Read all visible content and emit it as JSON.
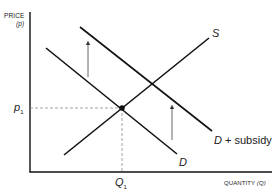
{
  "diagram": {
    "y_axis": {
      "title": "PRICE",
      "symbol": "(p)"
    },
    "x_axis": {
      "title": "QUANTITY",
      "symbol": "(Q)"
    },
    "equilibrium": {
      "price_label": "p",
      "price_sub": "1",
      "quantity_label": "Q",
      "quantity_sub": "1"
    },
    "curves": {
      "supply": {
        "label": "S"
      },
      "demand": {
        "label": "D"
      },
      "demand_subsidy": {
        "label_var": "D",
        "label_rest": " + subsidy"
      }
    },
    "colors": {
      "line": "#111111",
      "arrow": "#555555",
      "guide": "#8a8a8a"
    }
  }
}
